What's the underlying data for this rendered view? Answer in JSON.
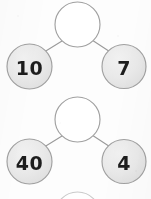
{
  "worksheet": {
    "title": "Number Bonds",
    "background_color": "#fdfdfd",
    "node_fill_color": "#e8e8e8",
    "node_stroke_color": "#a0a0a0",
    "connector_color": "#9a9a9a",
    "digit_color": "#1d1d1d"
  },
  "bonds": [
    {
      "id": "bond-1",
      "whole": {
        "value": "",
        "state": "empty",
        "cx": 77.5,
        "cy": 24.5,
        "r": 22.5
      },
      "parts": [
        {
          "value": "10",
          "state": "filled",
          "side": "left",
          "cx": 29.5,
          "cy": 66.5,
          "r": 22.5
        },
        {
          "value": "7",
          "state": "filled",
          "side": "right",
          "cx": 124.0,
          "cy": 66.5,
          "r": 22.0
        }
      ]
    },
    {
      "id": "bond-2",
      "whole": {
        "value": "",
        "state": "empty",
        "cx": 77.5,
        "cy": 119.5,
        "r": 22.5
      },
      "parts": [
        {
          "value": "40",
          "state": "filled",
          "side": "left",
          "cx": 29.5,
          "cy": 161.5,
          "r": 22.5
        },
        {
          "value": "4",
          "state": "filled",
          "side": "right",
          "cx": 124.0,
          "cy": 161.5,
          "r": 22.0
        }
      ]
    },
    {
      "id": "bond-3",
      "whole": {
        "value": "",
        "state": "empty",
        "cx": 77.5,
        "cy": 214.5,
        "r": 22.5
      },
      "parts": []
    }
  ]
}
